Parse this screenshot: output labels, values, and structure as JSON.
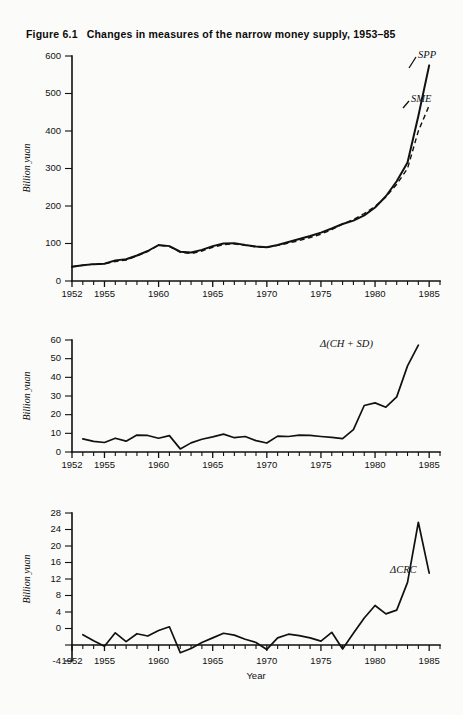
{
  "figure": {
    "number": "Figure 6.1",
    "title": "Changes in measures of the narrow money supply, 1953–85"
  },
  "chart_data": [
    {
      "type": "line",
      "panel": "top",
      "title": "Changes in measures of the narrow money supply, 1953–85",
      "xlabel": "",
      "ylabel": "Billion yuan",
      "xlim": [
        1952,
        1986
      ],
      "ylim": [
        0,
        600
      ],
      "ytick_labels": [
        "0",
        "100",
        "200",
        "300",
        "400",
        "500",
        "600"
      ],
      "yticks": [
        0,
        100,
        200,
        300,
        400,
        500,
        600
      ],
      "xtick_labels": [
        "1952",
        "1955",
        "1960",
        "1965",
        "1970",
        "1975",
        "1980",
        "1985"
      ],
      "xticks_major": [
        1952,
        1955,
        1960,
        1965,
        1970,
        1975,
        1980,
        1985
      ],
      "grid": false,
      "legend_position": "inline-right",
      "x": [
        1952,
        1953,
        1954,
        1955,
        1956,
        1957,
        1958,
        1959,
        1960,
        1961,
        1962,
        1963,
        1964,
        1965,
        1966,
        1967,
        1968,
        1969,
        1970,
        1971,
        1972,
        1973,
        1974,
        1975,
        1976,
        1977,
        1978,
        1979,
        1980,
        1981,
        1982,
        1983,
        1984,
        1985
      ],
      "series": [
        {
          "name": "SPP",
          "style": "solid",
          "values": [
            38,
            42,
            45,
            46,
            55,
            58,
            68,
            80,
            96,
            93,
            78,
            76,
            83,
            93,
            100,
            101,
            96,
            92,
            90,
            96,
            104,
            112,
            120,
            129,
            140,
            152,
            161,
            175,
            196,
            226,
            266,
            316,
            440,
            575
          ]
        },
        {
          "name": "SME",
          "style": "dashed",
          "values": [
            38,
            42,
            45,
            46,
            52,
            56,
            67,
            79,
            95,
            92,
            77,
            73,
            80,
            90,
            97,
            99,
            95,
            91,
            90,
            95,
            101,
            108,
            116,
            125,
            137,
            152,
            164,
            180,
            199,
            224,
            258,
            300,
            400,
            468
          ]
        }
      ]
    },
    {
      "type": "line",
      "panel": "middle",
      "xlabel": "",
      "ylabel": "Billion yuan",
      "xlim": [
        1952,
        1986
      ],
      "ylim": [
        -5,
        60
      ],
      "ytick_labels": [
        "0",
        "10",
        "20",
        "30",
        "40",
        "50",
        "60"
      ],
      "yticks": [
        0,
        10,
        20,
        30,
        40,
        50,
        60
      ],
      "xtick_labels": [
        "1952",
        "1955",
        "1960",
        "1965",
        "1970",
        "1975",
        "1980",
        "1985"
      ],
      "xticks_major": [
        1952,
        1955,
        1960,
        1965,
        1970,
        1975,
        1980,
        1985
      ],
      "grid": false,
      "x": [
        1953,
        1954,
        1955,
        1956,
        1957,
        1958,
        1959,
        1960,
        1961,
        1962,
        1963,
        1964,
        1965,
        1966,
        1967,
        1968,
        1969,
        1970,
        1971,
        1972,
        1973,
        1974,
        1975,
        1976,
        1977,
        1978,
        1979,
        1980,
        1981,
        1982,
        1983,
        1984
      ],
      "series": [
        {
          "name": "Δ(CH + SD)",
          "style": "solid",
          "values": [
            2.6,
            1.2,
            0.5,
            3.0,
            1.3,
            4.8,
            4.6,
            3.0,
            4.5,
            -3.2,
            0.3,
            2.4,
            3.8,
            5.4,
            3.3,
            4.0,
            1.6,
            0.2,
            4.2,
            4.0,
            4.8,
            4.6,
            4.0,
            3.5,
            2.8,
            8.0,
            22.0,
            23.5,
            21.0,
            27.0,
            45.0,
            57.0
          ]
        }
      ]
    },
    {
      "type": "line",
      "panel": "bottom",
      "xlabel": "Year",
      "ylabel": "Billion yuan",
      "xlim": [
        1952,
        1986
      ],
      "ylim": [
        -4,
        28
      ],
      "ytick_labels": [
        "-4",
        "0",
        "4",
        "8",
        "12",
        "16",
        "20",
        "24",
        "28"
      ],
      "yticks": [
        -4,
        0,
        4,
        8,
        12,
        16,
        20,
        24,
        28
      ],
      "xtick_labels": [
        "1952",
        "1955",
        "1960",
        "1965",
        "1970",
        "1975",
        "1980",
        "1985"
      ],
      "xticks_major": [
        1952,
        1955,
        1960,
        1965,
        1970,
        1975,
        1980,
        1985
      ],
      "grid": false,
      "x": [
        1953,
        1954,
        1955,
        1956,
        1957,
        1958,
        1959,
        1960,
        1961,
        1962,
        1963,
        1964,
        1965,
        1966,
        1967,
        1968,
        1969,
        1970,
        1971,
        1972,
        1973,
        1974,
        1975,
        1976,
        1977,
        1978,
        1979,
        1980,
        1981,
        1982,
        1983,
        1984,
        1985
      ],
      "series": [
        {
          "name": "ΔCRC",
          "style": "solid",
          "values": [
            1.7,
            0.4,
            -0.8,
            2.1,
            0.2,
            1.9,
            1.4,
            2.6,
            3.4,
            -2.2,
            -1.3,
            0.0,
            1.0,
            2.0,
            1.6,
            0.7,
            0.0,
            -1.5,
            1.0,
            1.8,
            1.5,
            1.0,
            0.3,
            2.2,
            -1.4,
            2.0,
            5.3,
            8.0,
            6.2,
            7.0,
            13.0,
            26.0,
            15.0
          ]
        }
      ]
    }
  ]
}
